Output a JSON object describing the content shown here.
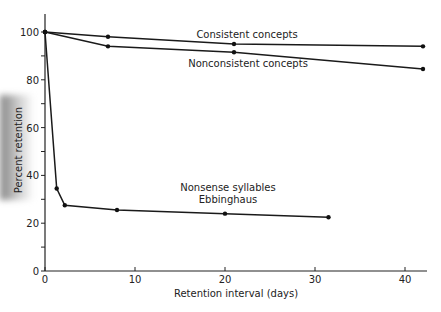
{
  "chart_data": {
    "type": "line",
    "title": "",
    "xlabel": "Retention interval (days)",
    "ylabel": "Percent retention",
    "xlim": [
      0,
      43
    ],
    "ylim": [
      0,
      108
    ],
    "xticks": [
      0,
      10,
      20,
      30,
      40
    ],
    "yticks": [
      0,
      20,
      40,
      60,
      80,
      100
    ],
    "grid": false,
    "legend": "inline labels",
    "series": [
      {
        "name": "Consistent concepts",
        "points": [
          [
            0,
            100
          ],
          [
            7,
            98
          ],
          [
            21,
            95
          ],
          [
            42,
            94
          ]
        ]
      },
      {
        "name": "Nonconsistent concepts",
        "points": [
          [
            0,
            100
          ],
          [
            7,
            94
          ],
          [
            21,
            91.5
          ],
          [
            42,
            84.5
          ]
        ]
      },
      {
        "name": "Nonsense syllables Ebbinghaus",
        "points": [
          [
            0,
            100
          ],
          [
            1.3,
            34.5
          ],
          [
            2.2,
            27.5
          ],
          [
            8,
            25.5
          ],
          [
            20,
            24
          ],
          [
            31.5,
            22.5
          ]
        ]
      }
    ],
    "annotations": [
      {
        "text": "Consistent concepts",
        "x": 21,
        "y": 99
      },
      {
        "text": "Nonconsistent concepts",
        "x": 21,
        "y": 86
      },
      {
        "text": "Nonsense syllables",
        "x": 20,
        "y": 33
      },
      {
        "text": "Ebbinghaus",
        "x": 20,
        "y": 29
      }
    ]
  },
  "labels": {
    "xlabel": "Retention interval (days)",
    "ylabel": "Percent retention",
    "consistent": "Consistent concepts",
    "nonconsistent": "Nonconsistent concepts",
    "nonsense1": "Nonsense syllables",
    "nonsense2": "Ebbinghaus"
  }
}
